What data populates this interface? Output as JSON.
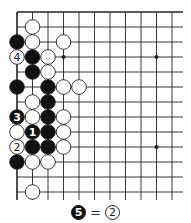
{
  "board": {
    "origin_x": 17,
    "origin_y": 12,
    "col_spacing": 15.5,
    "row_spacing": 15,
    "cols": 11,
    "rows": 13,
    "right_extent": 183,
    "bottom_extent": 200,
    "edges": {
      "top": true,
      "left": true,
      "right": false,
      "bottom": false
    },
    "star_points": [
      [
        3,
        3
      ],
      [
        9,
        3
      ],
      [
        9,
        9
      ]
    ],
    "stone_radius": 7.3,
    "colors": {
      "line": "#222222",
      "black": "#111111",
      "white": "#ffffff"
    }
  },
  "stones": [
    {
      "c": 1,
      "r": 1,
      "color": "white"
    },
    {
      "c": 0,
      "r": 2,
      "color": "black"
    },
    {
      "c": 1,
      "r": 2,
      "color": "white"
    },
    {
      "c": 3,
      "r": 2,
      "color": "white"
    },
    {
      "c": 0,
      "r": 3,
      "color": "white",
      "label": "4"
    },
    {
      "c": 1,
      "r": 3,
      "color": "black"
    },
    {
      "c": 2,
      "r": 3,
      "color": "white"
    },
    {
      "c": 1,
      "r": 4,
      "color": "black"
    },
    {
      "c": 2,
      "r": 4,
      "color": "white"
    },
    {
      "c": 0,
      "r": 5,
      "color": "black"
    },
    {
      "c": 2,
      "r": 5,
      "color": "black"
    },
    {
      "c": 3,
      "r": 5,
      "color": "white"
    },
    {
      "c": 4,
      "r": 5,
      "color": "white"
    },
    {
      "c": 1,
      "r": 6,
      "color": "white"
    },
    {
      "c": 2,
      "r": 6,
      "color": "black"
    },
    {
      "c": 0,
      "r": 7,
      "color": "black",
      "label": "3"
    },
    {
      "c": 1,
      "r": 7,
      "color": "white"
    },
    {
      "c": 2,
      "r": 7,
      "color": "black"
    },
    {
      "c": 3,
      "r": 7,
      "color": "white"
    },
    {
      "c": 0,
      "r": 8,
      "color": "white"
    },
    {
      "c": 1,
      "r": 8,
      "color": "black",
      "label": "1"
    },
    {
      "c": 2,
      "r": 8,
      "color": "black"
    },
    {
      "c": 3,
      "r": 8,
      "color": "white"
    },
    {
      "c": 0,
      "r": 9,
      "color": "white",
      "label": "2"
    },
    {
      "c": 1,
      "r": 9,
      "color": "black"
    },
    {
      "c": 2,
      "r": 9,
      "color": "black"
    },
    {
      "c": 3,
      "r": 9,
      "color": "white"
    },
    {
      "c": 0,
      "r": 10,
      "color": "black"
    },
    {
      "c": 1,
      "r": 10,
      "color": "white"
    },
    {
      "c": 2,
      "r": 10,
      "color": "white"
    },
    {
      "c": 1,
      "r": 12,
      "color": "white"
    }
  ],
  "caption": {
    "left_stone": {
      "color": "black",
      "label": "5"
    },
    "equals": "=",
    "right_stone": {
      "color": "white",
      "label": "2"
    }
  }
}
